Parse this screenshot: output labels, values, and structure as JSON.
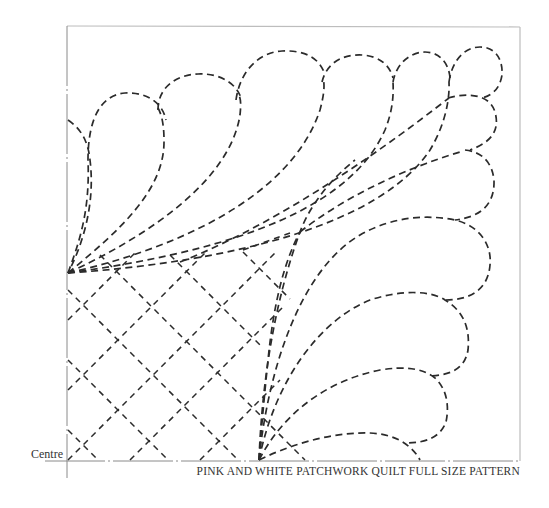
{
  "pattern": {
    "centre_label": "Centre",
    "caption": "PINK AND WHITE PATCHWORK QUILT FULL SIZE PATTERN",
    "line_color": "#2b2b2b",
    "frame_color": "#bdbdbd"
  }
}
